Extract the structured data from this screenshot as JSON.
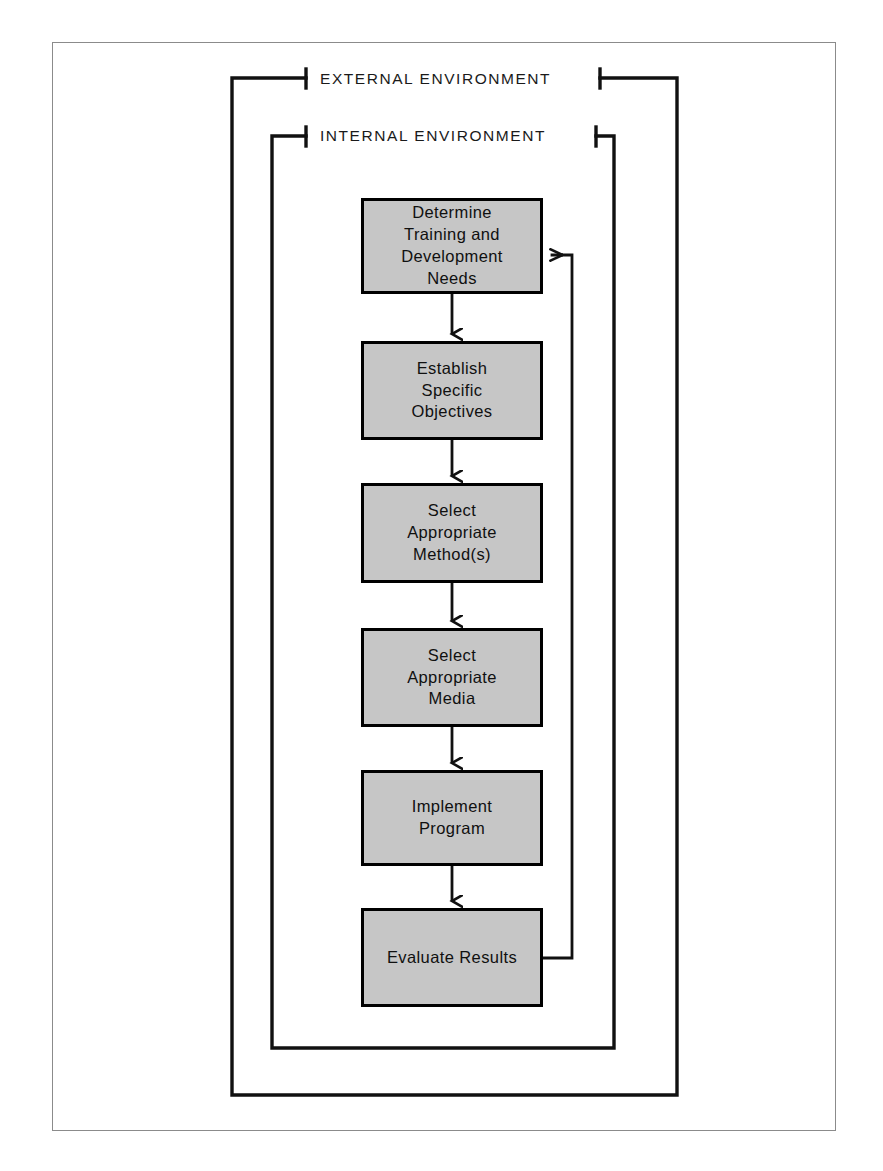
{
  "diagram": {
    "colors": {
      "node_fill": "#c6c6c6",
      "node_border": "#000000",
      "line": "#111111",
      "page_border": "#8b8b8b",
      "background": "#ffffff",
      "text": "#101010"
    },
    "boundaries": [
      {
        "id": "external",
        "label": "EXTERNAL ENVIRONMENT"
      },
      {
        "id": "internal",
        "label": "INTERNAL ENVIRONMENT"
      }
    ],
    "nodes": [
      {
        "id": "node-1",
        "label": "Determine\nTraining and\nDevelopment\nNeeds",
        "x": 361,
        "y": 198,
        "w": 182,
        "h": 96
      },
      {
        "id": "node-2",
        "label": "Establish\nSpecific\nObjectives",
        "x": 361,
        "y": 341,
        "w": 182,
        "h": 99
      },
      {
        "id": "node-3",
        "label": "Select\nAppropriate\nMethod(s)",
        "x": 361,
        "y": 483,
        "w": 182,
        "h": 100
      },
      {
        "id": "node-4",
        "label": "Select\nAppropriate\nMedia",
        "x": 361,
        "y": 628,
        "w": 182,
        "h": 99
      },
      {
        "id": "node-5",
        "label": "Implement\nProgram",
        "x": 361,
        "y": 770,
        "w": 182,
        "h": 96
      },
      {
        "id": "node-6",
        "label": "Evaluate Results",
        "x": 361,
        "y": 908,
        "w": 182,
        "h": 99
      }
    ],
    "flow_edges": [
      {
        "from": "node-1",
        "to": "node-2",
        "kind": "arrow-down"
      },
      {
        "from": "node-2",
        "to": "node-3",
        "kind": "arrow-down"
      },
      {
        "from": "node-3",
        "to": "node-4",
        "kind": "arrow-down"
      },
      {
        "from": "node-4",
        "to": "node-5",
        "kind": "arrow-down"
      },
      {
        "from": "node-5",
        "to": "node-6",
        "kind": "arrow-down"
      },
      {
        "from": "node-6",
        "to": "node-1",
        "kind": "feedback-loop-right"
      }
    ]
  }
}
